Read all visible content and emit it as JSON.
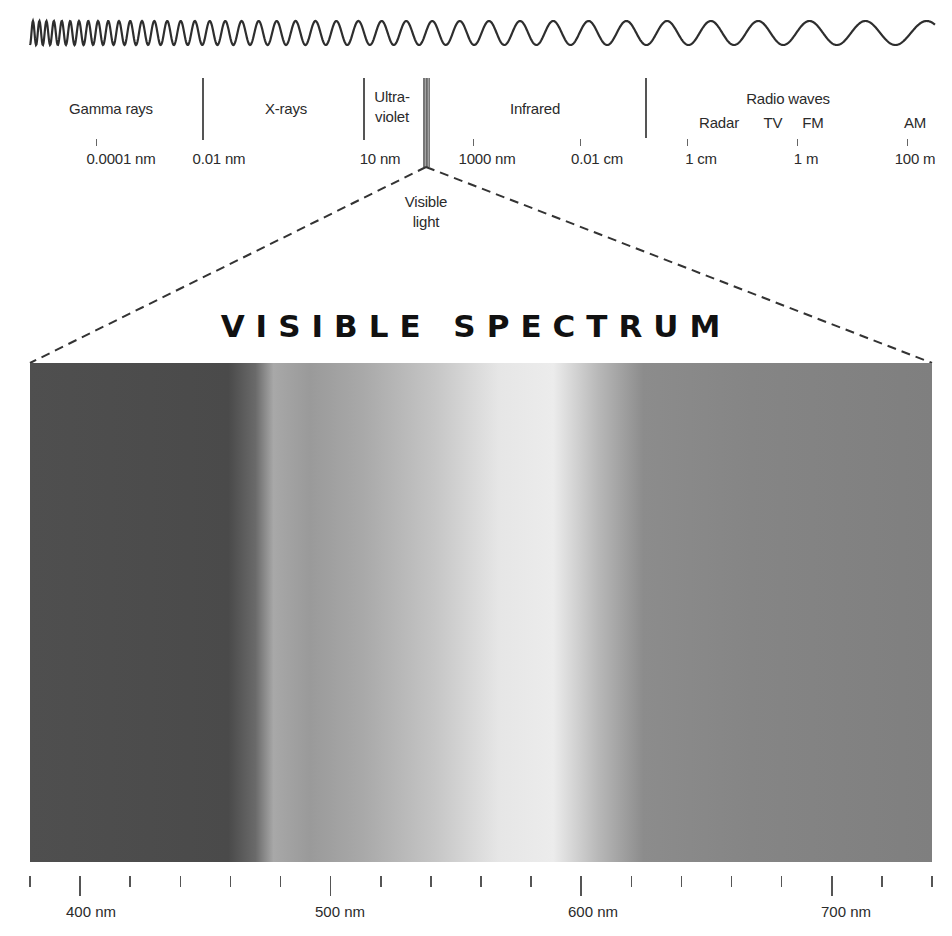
{
  "wave": {
    "description": "sine wave of decreasing frequency from left (short wavelength) to right (long wavelength)",
    "color": "#2e2e2e"
  },
  "em_scale": {
    "regions": [
      {
        "id": "gamma",
        "label": "Gamma rays"
      },
      {
        "id": "xray",
        "label": "X-rays"
      },
      {
        "id": "uv",
        "label_line1": "Ultra-",
        "label_line2": "violet"
      },
      {
        "id": "infrared",
        "label": "Infrared"
      },
      {
        "id": "radio",
        "label": "Radio waves"
      }
    ],
    "radio_subbands": [
      {
        "label": "Radar"
      },
      {
        "label": "TV"
      },
      {
        "label": "FM"
      },
      {
        "label": "AM"
      }
    ],
    "wavelength_labels": [
      {
        "label": "0.0001 nm"
      },
      {
        "label": "0.01 nm"
      },
      {
        "label": "10 nm"
      },
      {
        "label": "1000 nm"
      },
      {
        "label": "0.01 cm"
      },
      {
        "label": "1 cm"
      },
      {
        "label": "1 m"
      },
      {
        "label": "100 m"
      }
    ],
    "visible_callout": {
      "line1": "Visible",
      "line2": "light"
    }
  },
  "visible_spectrum": {
    "title": "VISIBLE SPECTRUM",
    "range_nm": [
      380,
      740
    ],
    "axis_labels": [
      {
        "label": "400 nm",
        "value": 400
      },
      {
        "label": "500 nm",
        "value": 500
      },
      {
        "label": "600 nm",
        "value": 600
      },
      {
        "label": "700 nm",
        "value": 700
      }
    ],
    "minor_tick_step_nm": 20,
    "rendering": "grayscale",
    "gradient_stops": [
      {
        "pos": 0.0,
        "color": "#4f4f4f"
      },
      {
        "pos": 0.22,
        "color": "#4a4a4a"
      },
      {
        "pos": 0.25,
        "color": "#6a6a6a"
      },
      {
        "pos": 0.27,
        "color": "#a8a8a8"
      },
      {
        "pos": 0.31,
        "color": "#9a9a9a"
      },
      {
        "pos": 0.37,
        "color": "#a9a9a9"
      },
      {
        "pos": 0.45,
        "color": "#c6c6c6"
      },
      {
        "pos": 0.52,
        "color": "#e6e6e6"
      },
      {
        "pos": 0.58,
        "color": "#ececec"
      },
      {
        "pos": 0.63,
        "color": "#b8b8b8"
      },
      {
        "pos": 0.68,
        "color": "#8c8c8c"
      },
      {
        "pos": 0.8,
        "color": "#858585"
      },
      {
        "pos": 1.0,
        "color": "#7f7f7f"
      }
    ]
  }
}
